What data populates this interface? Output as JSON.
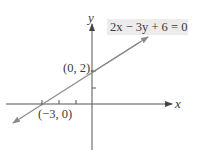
{
  "figure": {
    "equation": "2x − 3y + 6 = 0",
    "axes": {
      "x_label": "x",
      "y_label": "y"
    },
    "points": [
      {
        "label": "(0, 2)",
        "x": 0,
        "y": 2
      },
      {
        "label": "(−3, 0)",
        "x": -3,
        "y": 0
      }
    ],
    "ticks": {
      "x": [
        -3,
        -2,
        -1
      ],
      "y": [
        1,
        2
      ]
    },
    "colors": {
      "line": "#8a8a8a",
      "axes": "#555555",
      "label_bg": "#ececec",
      "text": "#3a3a3a"
    }
  }
}
